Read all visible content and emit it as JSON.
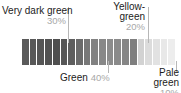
{
  "chart_data": {
    "type": "bar",
    "title": "",
    "xlabel": "",
    "ylabel": "",
    "legend_position": "callouts",
    "grid": false,
    "categories": [
      "Very dark green",
      "Green",
      "Yellow-green",
      "Pale green"
    ],
    "values": [
      30,
      20,
      40,
      10
    ],
    "value_unit": "%",
    "swatch_count": 20,
    "swatch_colors": [
      "#5a5a5a",
      "#585858",
      "#555555",
      "#525252",
      "#4f4f4f",
      "#565656",
      "#5e5e5e",
      "#6b6b6b",
      "#787878",
      "#818181",
      "#888888",
      "#8c8c8c",
      "#8a8a8a",
      "#868686",
      "#7f7f7f",
      "#d2d2d2",
      "#dcdcdc",
      "#e2e2e2",
      "#e8e8e8",
      "#ededed"
    ]
  },
  "callouts": {
    "very_dark_green": {
      "name": "Very dark green",
      "pct": "30%"
    },
    "yellow_green": {
      "name": "Yellow-\ngreen",
      "name_line1": "Yellow-",
      "name_line2": "green",
      "pct": "20%"
    },
    "green": {
      "name": "Green",
      "pct": "40%"
    },
    "pale_green": {
      "name_line1": "Pale",
      "name_line2": "green",
      "pct": "10%"
    }
  },
  "colors": {
    "text": "#1c1c1c",
    "muted_text": "#a8a8a8",
    "leader_line": "#b7b7b7",
    "background": "#ffffff"
  }
}
